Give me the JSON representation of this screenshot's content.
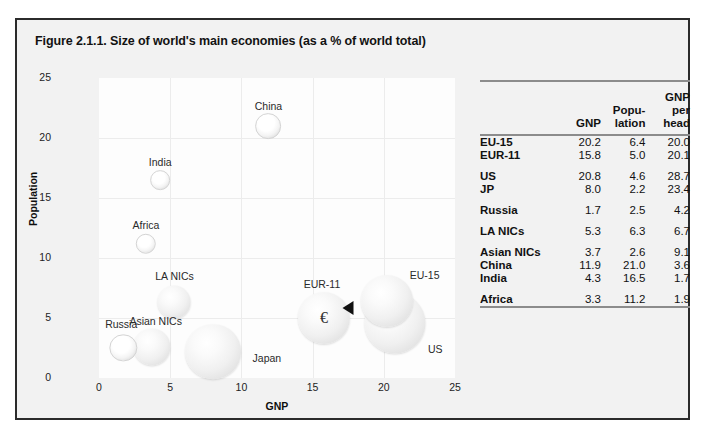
{
  "figure": {
    "title": "Figure 2.1.1. Size of world's main economies (as a % of world total)"
  },
  "chart_data": {
    "type": "scatter",
    "title": "Size of world's main economies (as a % of world total)",
    "xlabel": "GNP",
    "ylabel": "Population",
    "xlim": [
      0,
      25
    ],
    "ylim": [
      0,
      25
    ],
    "xticks": [
      "0",
      "5",
      "10",
      "15",
      "20",
      "25"
    ],
    "yticks": [
      "0",
      "5",
      "10",
      "15",
      "20",
      "25"
    ],
    "grid": true,
    "legend": "none",
    "size_encoding": "GNP per head",
    "points": [
      {
        "label": "China",
        "x": 11.9,
        "y": 21.0,
        "size": 3.6,
        "label_dx": 0,
        "label_dy": -20
      },
      {
        "label": "India",
        "x": 4.3,
        "y": 16.5,
        "size": 1.7,
        "label_dx": 0,
        "label_dy": -18
      },
      {
        "label": "Africa",
        "x": 3.3,
        "y": 11.2,
        "size": 1.9,
        "label_dx": 0,
        "label_dy": -19
      },
      {
        "label": "LA NICs",
        "x": 5.3,
        "y": 6.3,
        "size": 6.7,
        "label_dx": 0,
        "label_dy": -26
      },
      {
        "label": "Asian NICs",
        "x": 3.7,
        "y": 2.6,
        "size": 9.1,
        "label_dx": 4,
        "label_dy": -26
      },
      {
        "label": "Russia",
        "x": 1.7,
        "y": 2.5,
        "size": 4.2,
        "label_dx": -2,
        "label_dy": -24
      },
      {
        "label": "Japan",
        "x": 8.0,
        "y": 2.2,
        "size": 23.4,
        "label_dx": 54,
        "label_dy": 6
      },
      {
        "label": "EUR-11",
        "x": 15.8,
        "y": 5.0,
        "size": 20.1,
        "label_dx": -2,
        "label_dy": -34
      },
      {
        "label": "EU-15",
        "x": 20.2,
        "y": 6.4,
        "size": 20.0,
        "label_dx": 38,
        "label_dy": -26
      },
      {
        "label": "US",
        "x": 20.8,
        "y": 4.6,
        "size": 28.7,
        "label_dx": 40,
        "label_dy": 26
      }
    ],
    "annotations": [
      {
        "kind": "euro-symbol",
        "text": "€",
        "on": "EUR-11"
      },
      {
        "kind": "pointer-arrow",
        "direction": "left",
        "x": 17.5,
        "y": 5.8
      }
    ]
  },
  "table": {
    "headers": {
      "corner": "",
      "gnp": "GNP",
      "population": [
        "Popu-",
        "lation"
      ],
      "gnp_per_head": [
        "GNP",
        "per",
        "head"
      ]
    },
    "groups": [
      {
        "rows": [
          {
            "name": "EU-15",
            "gnp": "20.2",
            "population": "6.4",
            "gnp_per_head": "20.0"
          },
          {
            "name": "EUR-11",
            "gnp": "15.8",
            "population": "5.0",
            "gnp_per_head": "20.1"
          }
        ]
      },
      {
        "rows": [
          {
            "name": "US",
            "gnp": "20.8",
            "population": "4.6",
            "gnp_per_head": "28.7"
          },
          {
            "name": "JP",
            "gnp": "8.0",
            "population": "2.2",
            "gnp_per_head": "23.4"
          }
        ]
      },
      {
        "rows": [
          {
            "name": "Russia",
            "gnp": "1.7",
            "population": "2.5",
            "gnp_per_head": "4.2"
          }
        ]
      },
      {
        "rows": [
          {
            "name": "LA NICs",
            "gnp": "5.3",
            "population": "6.3",
            "gnp_per_head": "6.7"
          }
        ]
      },
      {
        "rows": [
          {
            "name": "Asian NICs",
            "gnp": "3.7",
            "population": "2.6",
            "gnp_per_head": "9.1"
          },
          {
            "name": "China",
            "gnp": "11.9",
            "population": "21.0",
            "gnp_per_head": "3.6"
          },
          {
            "name": "India",
            "gnp": "4.3",
            "population": "16.5",
            "gnp_per_head": "1.7"
          }
        ]
      },
      {
        "rows": [
          {
            "name": "Africa",
            "gnp": "3.3",
            "population": "11.2",
            "gnp_per_head": "1.9"
          }
        ]
      }
    ]
  },
  "colors": {
    "frame_border": "#2b2b2b",
    "figure_background": "#f2f2f2",
    "plot_background": "#fdfdfd",
    "gridline": "#ececec",
    "table_rule": "#8c8c8c",
    "text": "#111111",
    "arrow": "#111111"
  }
}
